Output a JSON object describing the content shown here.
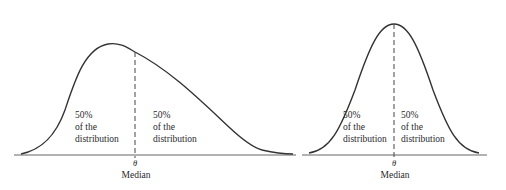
{
  "left_panel": {
    "description": "Skewed distribution",
    "left_label": [
      "50%",
      "of the",
      "distribution"
    ],
    "right_label": [
      "50%",
      "of the",
      "distribution"
    ],
    "theta": "θ",
    "median_label": "Median"
  },
  "right_panel": {
    "description": "Symmetric distribution",
    "left_label": [
      "50%",
      "of the",
      "distribution"
    ],
    "right_label": [
      "50%",
      "of the",
      "distribution"
    ],
    "theta": "θ",
    "median_label": "Median"
  },
  "colors": {
    "curve": "#333333",
    "axis": "#555555",
    "text": "#2a2a2a",
    "background": "#ffffff"
  }
}
